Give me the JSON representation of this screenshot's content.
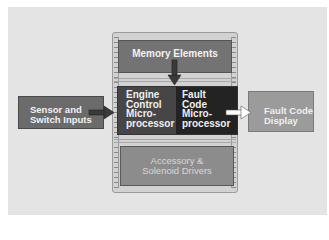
{
  "diagram": {
    "type": "block-diagram",
    "blocks": {
      "memory": {
        "label": "Memory Elements",
        "color": "#737373"
      },
      "engine_processor": {
        "lines": [
          "Engine",
          "Control",
          "Micro-",
          "processor"
        ],
        "color": "#464646"
      },
      "fault_processor": {
        "lines": [
          "Fault",
          "Code",
          "Micro-",
          "processor"
        ],
        "color": "#232323"
      },
      "accessory": {
        "lines": [
          "Accessory &",
          "Solenoid Drivers"
        ],
        "color": "#8c8c8c"
      },
      "sensor_inputs": {
        "lines": [
          "Sensor and",
          "Switch Inputs"
        ],
        "color": "#6b6b6b"
      },
      "fault_display": {
        "lines": [
          "Fault Code",
          "Display"
        ],
        "color": "#9b9b9b"
      }
    },
    "arrows": [
      {
        "from": "memory",
        "to": "fault_processor",
        "style": "dark",
        "direction": "down"
      },
      {
        "from": "sensor_inputs",
        "to": "engine_processor",
        "style": "dark",
        "direction": "right"
      },
      {
        "from": "fault_processor",
        "to": "fault_display",
        "style": "white",
        "direction": "right"
      }
    ],
    "colors": {
      "background_panel": "#e4e4e4",
      "chip_body": "#d2d2d2"
    }
  }
}
